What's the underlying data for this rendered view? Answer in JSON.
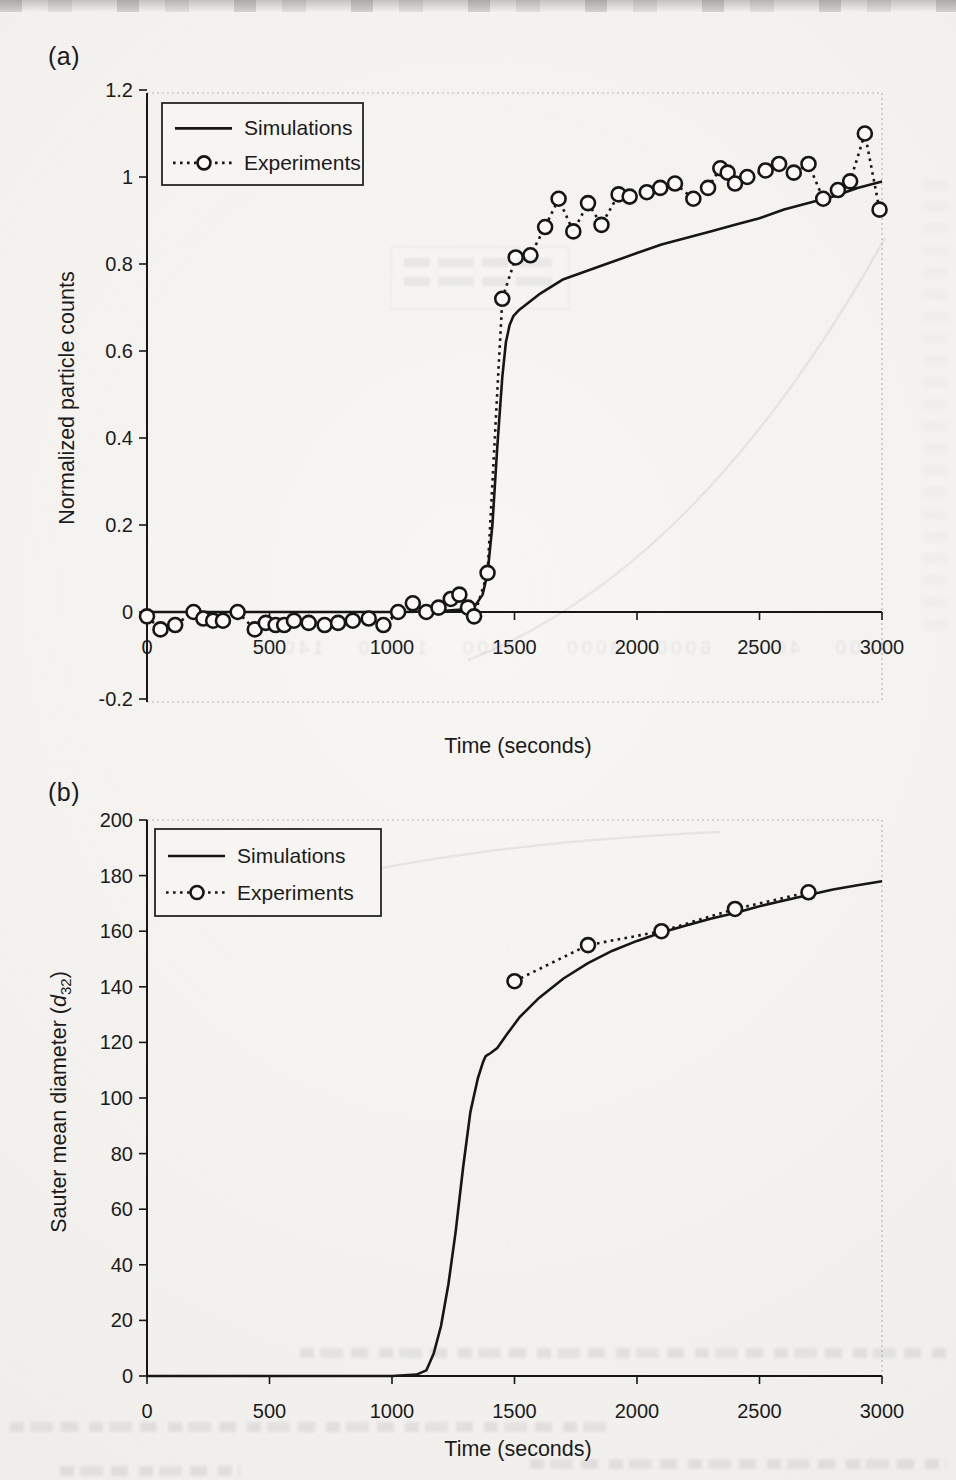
{
  "page": {
    "panel_a_label": "(a)",
    "panel_b_label": "(b)"
  },
  "colors": {
    "ink": "#161616",
    "paper": "#f2f1ee",
    "legend_fill": "#f6f5f2",
    "muted_border": "#b8b6b0",
    "text": "#1b1b1b"
  },
  "artifacts": {
    "ghost_axis_numbers": "2000  4000  6000  8000  10000  12000  14000"
  },
  "chart_data": [
    {
      "id": "a",
      "type": "line",
      "title": "",
      "xlabel": "Time (seconds)",
      "ylabel": "Normalized particle counts",
      "xlim": [
        0,
        3000
      ],
      "ylim": [
        -0.2,
        1.2
      ],
      "grid": false,
      "xticks": [
        0,
        500,
        1000,
        1500,
        2000,
        2500,
        3000
      ],
      "xtick_labels": [
        "0",
        "500",
        "1000",
        "1500",
        "2000",
        "2500",
        "3000"
      ],
      "yticks": [
        1.2,
        1,
        0.8,
        0.6,
        0.4,
        0.2,
        0,
        -0.2
      ],
      "ytick_labels": [
        "1.2",
        "1",
        "0.8",
        "0.6",
        "0.4",
        "0.2",
        "0",
        "-0.2"
      ],
      "legend": {
        "position": "top-left",
        "entries": [
          "Simulations",
          "Experiments"
        ]
      },
      "series": [
        {
          "name": "Simulations",
          "style": "solid-line",
          "points": [
            [
              0,
              0
            ],
            [
              150,
              0
            ],
            [
              300,
              0
            ],
            [
              450,
              0
            ],
            [
              600,
              0
            ],
            [
              750,
              0
            ],
            [
              900,
              0
            ],
            [
              1050,
              0
            ],
            [
              1200,
              0.002
            ],
            [
              1300,
              0.006
            ],
            [
              1340,
              0.015
            ],
            [
              1370,
              0.04
            ],
            [
              1390,
              0.09
            ],
            [
              1410,
              0.2
            ],
            [
              1430,
              0.38
            ],
            [
              1450,
              0.54
            ],
            [
              1465,
              0.62
            ],
            [
              1480,
              0.66
            ],
            [
              1495,
              0.68
            ],
            [
              1520,
              0.695
            ],
            [
              1600,
              0.73
            ],
            [
              1700,
              0.765
            ],
            [
              1800,
              0.785
            ],
            [
              1900,
              0.805
            ],
            [
              2000,
              0.825
            ],
            [
              2100,
              0.845
            ],
            [
              2200,
              0.86
            ],
            [
              2300,
              0.875
            ],
            [
              2400,
              0.89
            ],
            [
              2500,
              0.905
            ],
            [
              2600,
              0.925
            ],
            [
              2700,
              0.94
            ],
            [
              2800,
              0.955
            ],
            [
              2900,
              0.975
            ],
            [
              3000,
              0.99
            ]
          ]
        },
        {
          "name": "Experiments",
          "style": "dotted-open-circles",
          "points": [
            [
              0,
              -0.01
            ],
            [
              55,
              -0.04
            ],
            [
              115,
              -0.03
            ],
            [
              190,
              0
            ],
            [
              230,
              -0.015
            ],
            [
              270,
              -0.02
            ],
            [
              310,
              -0.02
            ],
            [
              370,
              0
            ],
            [
              440,
              -0.04
            ],
            [
              485,
              -0.025
            ],
            [
              525,
              -0.03
            ],
            [
              560,
              -0.03
            ],
            [
              600,
              -0.02
            ],
            [
              660,
              -0.025
            ],
            [
              725,
              -0.03
            ],
            [
              780,
              -0.025
            ],
            [
              840,
              -0.02
            ],
            [
              905,
              -0.015
            ],
            [
              965,
              -0.03
            ],
            [
              1025,
              0
            ],
            [
              1085,
              0.02
            ],
            [
              1140,
              0
            ],
            [
              1190,
              0.01
            ],
            [
              1240,
              0.03
            ],
            [
              1275,
              0.04
            ],
            [
              1310,
              0.01
            ],
            [
              1335,
              -0.01
            ],
            [
              1390,
              0.09
            ],
            [
              1450,
              0.72
            ],
            [
              1505,
              0.815
            ],
            [
              1565,
              0.82
            ],
            [
              1625,
              0.885
            ],
            [
              1680,
              0.95
            ],
            [
              1740,
              0.875
            ],
            [
              1800,
              0.94
            ],
            [
              1855,
              0.89
            ],
            [
              1925,
              0.96
            ],
            [
              1970,
              0.955
            ],
            [
              2040,
              0.965
            ],
            [
              2095,
              0.975
            ],
            [
              2155,
              0.985
            ],
            [
              2230,
              0.95
            ],
            [
              2290,
              0.975
            ],
            [
              2340,
              1.02
            ],
            [
              2370,
              1.01
            ],
            [
              2400,
              0.985
            ],
            [
              2450,
              1.0
            ],
            [
              2525,
              1.015
            ],
            [
              2580,
              1.03
            ],
            [
              2640,
              1.01
            ],
            [
              2700,
              1.03
            ],
            [
              2760,
              0.95
            ],
            [
              2820,
              0.97
            ],
            [
              2870,
              0.99
            ],
            [
              2930,
              1.1
            ],
            [
              2990,
              0.925
            ]
          ]
        }
      ]
    },
    {
      "id": "b",
      "type": "line",
      "title": "",
      "xlabel": "Time (seconds)",
      "ylabel": "Sauter mean diameter (d32)",
      "ylabel_parts": [
        {
          "text": "Sauter mean diameter ("
        },
        {
          "text": "d",
          "italic": true
        },
        {
          "text": "32",
          "sub": true
        },
        {
          "text": ")"
        }
      ],
      "xlim": [
        0,
        3000
      ],
      "ylim": [
        0,
        200
      ],
      "grid": false,
      "xticks": [
        0,
        500,
        1000,
        1500,
        2000,
        2500,
        3000
      ],
      "xtick_labels": [
        "0",
        "500",
        "1000",
        "1500",
        "2000",
        "2500",
        "3000"
      ],
      "yticks": [
        200,
        180,
        160,
        140,
        120,
        100,
        80,
        60,
        40,
        20,
        0
      ],
      "ytick_labels": [
        "200",
        "180",
        "160",
        "140",
        "120",
        "100",
        "80",
        "60",
        "40",
        "20",
        "0"
      ],
      "legend": {
        "position": "top-left",
        "entries": [
          "Simulations",
          "Experiments"
        ]
      },
      "series": [
        {
          "name": "Simulations",
          "style": "solid-line",
          "points": [
            [
              0,
              0
            ],
            [
              200,
              0
            ],
            [
              400,
              0
            ],
            [
              600,
              0
            ],
            [
              800,
              0
            ],
            [
              1000,
              0
            ],
            [
              1100,
              0.5
            ],
            [
              1140,
              2
            ],
            [
              1170,
              8
            ],
            [
              1200,
              18
            ],
            [
              1230,
              33
            ],
            [
              1260,
              52
            ],
            [
              1290,
              75
            ],
            [
              1320,
              95
            ],
            [
              1350,
              107
            ],
            [
              1372,
              113
            ],
            [
              1382,
              115
            ],
            [
              1390,
              115.5
            ],
            [
              1400,
              116
            ],
            [
              1430,
              118
            ],
            [
              1470,
              123
            ],
            [
              1520,
              129
            ],
            [
              1600,
              136
            ],
            [
              1700,
              143
            ],
            [
              1800,
              148.5
            ],
            [
              1900,
              153
            ],
            [
              2000,
              156.5
            ],
            [
              2100,
              159.5
            ],
            [
              2200,
              162
            ],
            [
              2300,
              164.5
            ],
            [
              2400,
              166.5
            ],
            [
              2500,
              169
            ],
            [
              2600,
              171
            ],
            [
              2700,
              173
            ],
            [
              2800,
              175
            ],
            [
              2900,
              176.5
            ],
            [
              3000,
              178
            ]
          ]
        },
        {
          "name": "Experiments",
          "style": "dotted-open-circles",
          "points": [
            [
              1500,
              142
            ],
            [
              1800,
              155
            ],
            [
              2100,
              160
            ],
            [
              2400,
              168
            ],
            [
              2700,
              174
            ]
          ]
        }
      ]
    }
  ]
}
